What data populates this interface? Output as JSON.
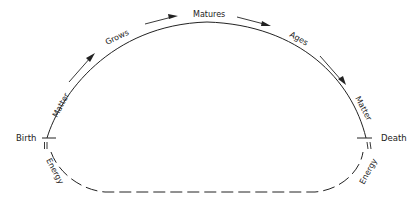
{
  "diagram": {
    "type": "life-cycle",
    "nodes": {
      "start": "Birth",
      "end": "Death"
    },
    "upper_arc_labels": [
      "Matter",
      "Grows",
      "Matures",
      "Ages",
      "Matter"
    ],
    "lower_arc_labels": [
      "Energy",
      "Energy"
    ],
    "upper_arc_style": "solid",
    "lower_arc_style": "dashed",
    "colors": {
      "line": "#222222",
      "background": "#ffffff"
    }
  }
}
